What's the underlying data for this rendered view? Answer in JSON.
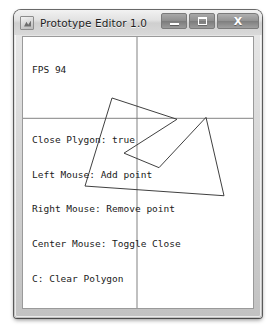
{
  "window": {
    "title": "Prototype Editor 1.0",
    "app_icon": "polygon-app-icon",
    "controls": {
      "minimize_label": "–",
      "maximize_label": "□",
      "close_label": "X",
      "minimize_name": "minimize",
      "maximize_name": "maximize",
      "close_name": "close"
    }
  },
  "hud": {
    "fps": "FPS 94",
    "lines": [
      "Close Plygon: true",
      "Left Mouse: Add point",
      "Right Mouse: Remove point",
      "Center Mouse: Toggle Close",
      "C: Clear Polygon",
      "Space Bar: Print Polygon"
    ]
  },
  "canvas": {
    "background_color": "#ffffff",
    "axis_color": "#808080",
    "polygon_stroke": "#3c3c3c",
    "axes": {
      "horizontal_y": 84,
      "vertical_x": 114
    },
    "polygon": {
      "closed": true,
      "points": "89,63 154,85 101,120 136,135 183,83 201,164 62,154"
    }
  },
  "colors": {
    "titlebar_text": "#1d1d1d",
    "frame": "#c2c2c2",
    "client_border": "#9a9a9a"
  }
}
